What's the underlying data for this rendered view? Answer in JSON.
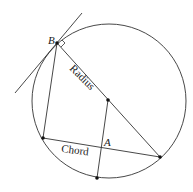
{
  "diagram": {
    "labels": {
      "point_b": "B",
      "point_a": "A",
      "radius": "Radius",
      "chord": "Chord"
    },
    "colors": {
      "stroke": "#333333",
      "background": "#ffffff"
    },
    "circle": {
      "cx": 109,
      "cy": 101,
      "r": 76
    },
    "points": {
      "B": [
        57,
        43
      ],
      "center": [
        108,
        100
      ],
      "right": [
        160,
        157
      ],
      "left": [
        43,
        138
      ],
      "bottom": [
        97,
        178
      ],
      "A": [
        101,
        147
      ]
    }
  }
}
